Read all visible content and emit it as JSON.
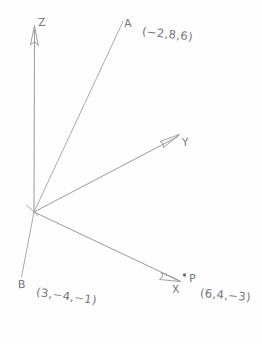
{
  "diagram": {
    "title_text": "",
    "background_color": "#fefefe",
    "line_color": "#8d8d95",
    "text_color": "#76767e",
    "axes": [
      {
        "name": "z-axis",
        "label": "Z",
        "direction": "up"
      },
      {
        "name": "y-axis",
        "label": "Y",
        "direction": "upper-right"
      },
      {
        "name": "x-axis",
        "label": "X",
        "direction": "lower-right"
      }
    ],
    "axis_labels": {
      "z": "Z",
      "y": "Y",
      "x": "X"
    },
    "points": [
      {
        "name": "point-a",
        "label": "A",
        "coordinates": "(−2,8,6)",
        "x": -2,
        "y": 8,
        "z": 6,
        "marker": "ray"
      },
      {
        "name": "point-b",
        "label": "B",
        "coordinates": "(3,−4,−1)",
        "x": 3,
        "y": -4,
        "z": -1,
        "marker": "ray"
      },
      {
        "name": "point-p",
        "label": "P",
        "coordinates": "(6,4,−3)",
        "x": 6,
        "y": 4,
        "z": -3,
        "marker": "dot"
      }
    ],
    "point_labels": {
      "a": "A",
      "a_coords": "(−2,8,6)",
      "b": "B",
      "b_coords": "(3,−4,−1)",
      "p": "P",
      "p_coords": "(6,4,−3)"
    }
  }
}
